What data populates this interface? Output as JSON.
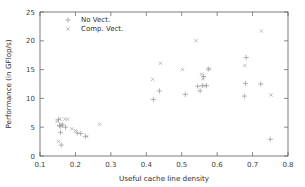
{
  "chart_data": {
    "type": "scatter",
    "title": "",
    "xlabel": "Useful cache line density",
    "ylabel": "Performance (in GFlop/s)",
    "xlim": [
      0.1,
      0.8
    ],
    "ylim": [
      0,
      25
    ],
    "xticks": [
      "0.1",
      "0.2",
      "0.3",
      "0.4",
      "0.5",
      "0.6",
      "0.7",
      "0.8"
    ],
    "xtick_values": [
      0.1,
      0.2,
      0.3,
      0.4,
      0.5,
      0.6,
      0.7,
      0.8
    ],
    "yticks": [
      "0",
      "5",
      "10",
      "15",
      "20",
      "25"
    ],
    "ytick_values": [
      0,
      5,
      10,
      15,
      20,
      25
    ],
    "grid": false,
    "legend_position": "top-left-inside",
    "series": [
      {
        "name": "No Vect.",
        "marker": "plus",
        "color": "#9a9a9a",
        "points": [
          [
            0.152,
            6.3
          ],
          [
            0.155,
            5.3
          ],
          [
            0.157,
            5.2
          ],
          [
            0.158,
            4.1
          ],
          [
            0.16,
            1.9
          ],
          [
            0.163,
            5.4
          ],
          [
            0.172,
            5.0
          ],
          [
            0.205,
            4.0
          ],
          [
            0.215,
            3.9
          ],
          [
            0.228,
            3.4
          ],
          [
            0.42,
            9.8
          ],
          [
            0.437,
            11.3
          ],
          [
            0.51,
            10.7
          ],
          [
            0.545,
            12.1
          ],
          [
            0.552,
            11.3
          ],
          [
            0.558,
            12.2
          ],
          [
            0.562,
            13.8
          ],
          [
            0.57,
            12.2
          ],
          [
            0.575,
            15.1
          ],
          [
            0.677,
            10.4
          ],
          [
            0.68,
            12.6
          ],
          [
            0.682,
            17.1
          ],
          [
            0.723,
            12.5
          ],
          [
            0.75,
            2.9
          ]
        ]
      },
      {
        "name": "Comp. Vect.",
        "marker": "cross",
        "color": "#a8a8a8",
        "points": [
          [
            0.148,
            6.0
          ],
          [
            0.152,
            2.5
          ],
          [
            0.156,
            6.4
          ],
          [
            0.16,
            5.2
          ],
          [
            0.163,
            5.5
          ],
          [
            0.17,
            6.4
          ],
          [
            0.178,
            6.4
          ],
          [
            0.19,
            4.7
          ],
          [
            0.2,
            4.4
          ],
          [
            0.232,
            3.4
          ],
          [
            0.268,
            5.5
          ],
          [
            0.418,
            13.3
          ],
          [
            0.44,
            16.1
          ],
          [
            0.502,
            15.0
          ],
          [
            0.54,
            20.0
          ],
          [
            0.556,
            14.2
          ],
          [
            0.56,
            13.4
          ],
          [
            0.565,
            12.2
          ],
          [
            0.578,
            15.1
          ],
          [
            0.678,
            15.7
          ],
          [
            0.725,
            21.7
          ],
          [
            0.752,
            10.6
          ]
        ]
      }
    ]
  }
}
